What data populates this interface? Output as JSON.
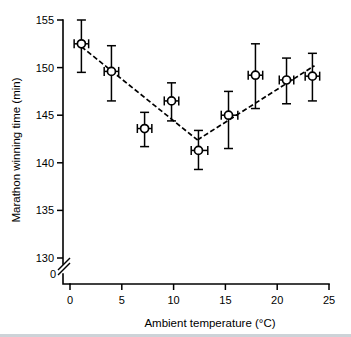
{
  "chart_data": {
    "type": "scatter",
    "title": "",
    "xlabel": "Ambient temperature (°C)",
    "ylabel": "Marathon winning time (min)",
    "xlim": [
      0,
      25
    ],
    "ylim": [
      130,
      155
    ],
    "xticks": [
      0,
      5,
      10,
      15,
      20,
      25
    ],
    "xticklabels": [
      "0",
      "5",
      "10",
      "15",
      "20",
      "25"
    ],
    "yticks": [
      130,
      135,
      140,
      145,
      150,
      155
    ],
    "yticklabels": [
      "130",
      "135",
      "140",
      "145",
      "150",
      "155"
    ],
    "y_axis_break": true,
    "y_break_label": "0",
    "grid": false,
    "legend": null,
    "marker": "open-circle",
    "error_bars": "x and y",
    "points": [
      {
        "x": 1.1,
        "y": 152.5,
        "yerr_low": 149.5,
        "yerr_high": 155.0,
        "xerr_low": 0.4,
        "xerr_high": 1.8
      },
      {
        "x": 4.0,
        "y": 149.6,
        "yerr_low": 146.5,
        "yerr_high": 152.3,
        "xerr_low": 3.3,
        "xerr_high": 4.7
      },
      {
        "x": 7.2,
        "y": 143.6,
        "yerr_low": 141.7,
        "yerr_high": 145.3,
        "xerr_low": 6.5,
        "xerr_high": 7.9
      },
      {
        "x": 9.8,
        "y": 146.5,
        "yerr_low": 144.4,
        "yerr_high": 148.4,
        "xerr_low": 9.1,
        "xerr_high": 10.5
      },
      {
        "x": 12.4,
        "y": 141.3,
        "yerr_low": 139.3,
        "yerr_high": 143.4,
        "xerr_low": 11.7,
        "xerr_high": 13.3
      },
      {
        "x": 15.3,
        "y": 145.0,
        "yerr_low": 141.5,
        "yerr_high": 147.5,
        "xerr_low": 14.6,
        "xerr_high": 16.2
      },
      {
        "x": 17.9,
        "y": 149.2,
        "yerr_low": 145.7,
        "yerr_high": 152.5,
        "xerr_low": 17.2,
        "xerr_high": 18.6
      },
      {
        "x": 20.9,
        "y": 148.7,
        "yerr_low": 146.2,
        "yerr_high": 151.0,
        "xerr_low": 20.2,
        "xerr_high": 21.6
      },
      {
        "x": 23.4,
        "y": 149.1,
        "yerr_low": 146.5,
        "yerr_high": 151.5,
        "xerr_low": 22.7,
        "xerr_high": 24.1
      }
    ],
    "fit_segments": [
      {
        "name": "descending-limb",
        "x1": 1.1,
        "y1": 152.2,
        "x2": 12.3,
        "y2": 142.4
      },
      {
        "name": "ascending-limb",
        "x1": 12.3,
        "y1": 142.4,
        "x2": 23.6,
        "y2": 150.2
      }
    ]
  }
}
